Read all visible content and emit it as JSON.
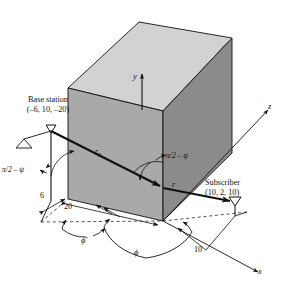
{
  "figure": {
    "type": "technical-diagram",
    "background_color": "#ffffff",
    "line_color": "#111111"
  },
  "box": {
    "name": "building",
    "faces": {
      "top_label": "top-face",
      "left_label": "left-face",
      "right_label": "right-face"
    },
    "colors": {
      "top": "#d2d2d2",
      "left": "#a8a8a8",
      "right": "#8a8a8a",
      "edge": "#111111"
    }
  },
  "axes": [
    {
      "id": "y",
      "label": "y",
      "direction": "up"
    },
    {
      "id": "z",
      "label": "z",
      "direction": "upper-right"
    },
    {
      "id": "x",
      "label": "x",
      "direction": "lower-right"
    }
  ],
  "nodes": {
    "base_station": {
      "title": "Base station",
      "coords": "(–6, 10, –20)",
      "icon": "antenna-icon"
    },
    "subscriber": {
      "title": "Subscriber",
      "coords": "(10, 2, 10)",
      "icon": "antenna-icon"
    }
  },
  "paths": {
    "incident": {
      "label": "r",
      "subscript": "0",
      "display": "r₀"
    },
    "diffracted": {
      "label": "r",
      "display": "r"
    }
  },
  "angles": [
    {
      "id": "psi-left",
      "label": "π/2 – ψ"
    },
    {
      "id": "psi-right",
      "label": "π/2 – ψ"
    },
    {
      "id": "phi-prime",
      "label": "ϕ′"
    },
    {
      "id": "phi",
      "label": "ϕ"
    }
  ],
  "dimensions": [
    {
      "id": "dim-6",
      "value": "6"
    },
    {
      "id": "dim-20",
      "value": "20"
    },
    {
      "id": "dim-10",
      "value": "10"
    }
  ]
}
